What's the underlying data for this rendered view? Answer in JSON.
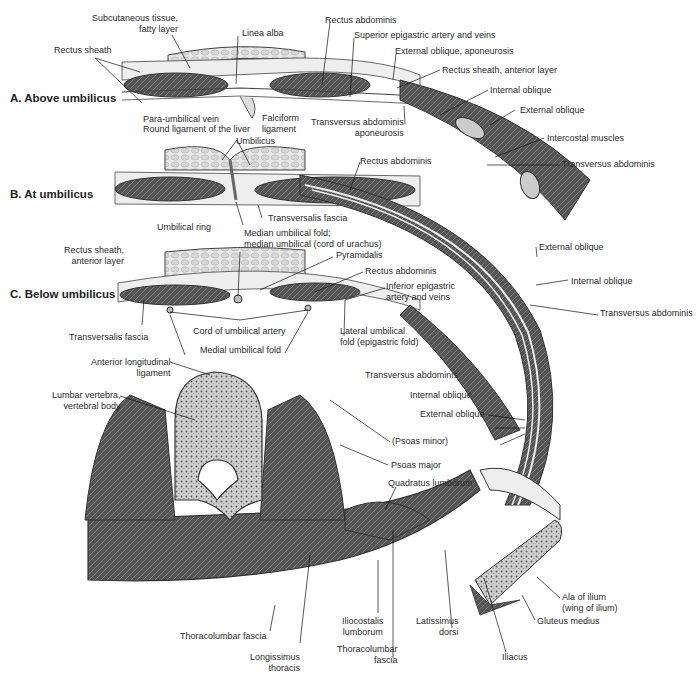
{
  "figure": {
    "colors": {
      "muscle_dark": "#4a4a4a",
      "muscle_mid": "#6e6e6e",
      "fascia_light": "#e6e6e6",
      "fat": "#d9d9d9",
      "bone": "#bdbdbd",
      "outline": "#333333",
      "leader": "#111111"
    },
    "sections": {
      "a": "A. Above umbilicus",
      "b": "B. At umbilicus",
      "c": "C. Below umbilicus"
    },
    "labels": {
      "subcutaneous_1": "Subcutaneous tissue,",
      "subcutaneous_2": "fatty layer",
      "linea_alba": "Linea alba",
      "rectus_sheath": "Rectus sheath",
      "rectus_abdominis_a": "Rectus abdominis",
      "superior_epigastric": "Superior epigastric artery and veins",
      "external_oblique_aponeurosis": "External oblique, aponeurosis",
      "rectus_sheath_anterior": "Rectus sheath, anterior layer",
      "internal_oblique_a": "Internal oblique",
      "external_oblique_a": "External oblique",
      "intercostal": "Intercostal muscles",
      "transversus_a": "Transversus abdominis",
      "para_umbilical_vein": "Para-umbilical vein",
      "round_ligament": "Round ligament of the liver",
      "falciform_1": "Falciform",
      "falciform_2": "ligament",
      "transversus_aponeurosis_1": "Transversus abdominis",
      "transversus_aponeurosis_2": "aponeurosis",
      "umbilicus": "Umbilicus",
      "rectus_abdominis_b": "Rectus abdominis",
      "umbilical_ring": "Umbilical ring",
      "transversalis_fascia_b": "Transversalis fascia",
      "median_fold_1": "Median umbilical fold;",
      "median_fold_2": "median umbilical (cord of urachus)",
      "rectus_sheath_ant_c_1": "Rectus sheath,",
      "rectus_sheath_ant_c_2": "anterior layer",
      "pyramidalis": "Pyramidalis",
      "rectus_abdominis_c": "Rectus abdominis",
      "inferior_epigastric_1": "Inferior epigastric",
      "inferior_epigastric_2": "artery and veins",
      "external_oblique_c": "External oblique",
      "internal_oblique_c": "Internal oblique",
      "transversus_c": "Transversus abdominis",
      "transversalis_fascia_c": "Transversalis fascia",
      "cord_umbilical_artery": "Cord of umbilical artery",
      "medial_umbilical_fold": "Medial umbilical fold",
      "lateral_fold_1": "Lateral umbilical",
      "lateral_fold_2": "fold (epigastric fold)",
      "anterior_longitudinal_1": "Anterior longitudinal",
      "anterior_longitudinal_2": "ligament",
      "lumbar_vertebra_1": "Lumbar vertebra,",
      "lumbar_vertebra_2": "vertebral body",
      "transversus_d": "Transversus abdominis",
      "internal_oblique_d": "Internal oblique",
      "external_oblique_d": "External oblique",
      "psoas_minor": "(Psoas minor)",
      "psoas_major": "Psoas major",
      "quadratus_lumborum": "Quadratus lumborum",
      "ala_ilium_1": "Ala of ilium",
      "ala_ilium_2": "(wing of ilium)",
      "gluteus_medius": "Gluteus medius",
      "thoracolumbar_fascia_l": "Thoracolumbar fascia",
      "longissimus_1": "Longissimus",
      "longissimus_2": "thoracis",
      "iliocostalis_1": "Iliocostalis",
      "iliocostalis_2": "lumborum",
      "thoracolumbar_fascia_r_1": "Thoracolumbar",
      "thoracolumbar_fascia_r_2": "fascia",
      "latissimus_1": "Latissimus",
      "latissimus_2": "dorsi",
      "iliacus": "Iliacus"
    }
  }
}
